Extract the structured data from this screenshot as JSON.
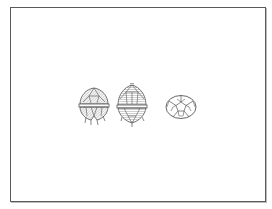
{
  "figure": {
    "frame_color": "#5a5a5a",
    "stroke_color": "#555555",
    "shade_color": "#9a9a9a",
    "specimens": [
      {
        "view": "lateral-ventral",
        "label": ""
      },
      {
        "view": "lateral-dorsal",
        "label": ""
      },
      {
        "view": "apical",
        "label": ""
      }
    ]
  }
}
